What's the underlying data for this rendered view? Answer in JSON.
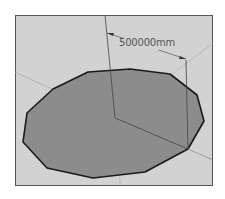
{
  "viewport": {
    "background": "#d2d2d2",
    "frame_color": "#555555"
  },
  "shape": {
    "type": "polygon-circle",
    "segments": 12,
    "fill": "#8c8c8c",
    "edge_color": "#1a1a1a",
    "points": "27,113 23,142 47,168 93,178 145,172 188,149 204,121 197,95 170,74 130,69 88,72 53,89"
  },
  "dimension": {
    "label": "500000mm",
    "color": "#555555"
  },
  "axes": {
    "color": "#9a9a9a"
  }
}
